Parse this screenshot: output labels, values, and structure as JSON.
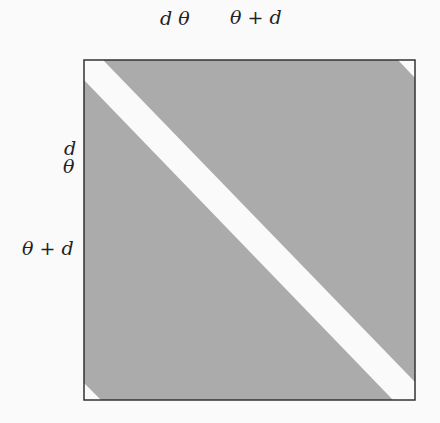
{
  "figure": {
    "type": "shaded-square-diagram",
    "colors": {
      "fill": "#ababab",
      "band": "#fafafa",
      "border": "#333333"
    },
    "square": {
      "x": 84,
      "y": 60,
      "width": 331,
      "height": 340
    },
    "top_labels": [
      {
        "text": "d θ",
        "x": 160,
        "y": 9
      },
      {
        "text": "θ + d",
        "x": 230,
        "y": 8
      }
    ],
    "left_labels": [
      {
        "text": "d",
        "x": 62,
        "y": 139
      },
      {
        "text": "θ",
        "x": 62,
        "y": 158
      },
      {
        "text": "θ + d",
        "x": 22,
        "y": 239
      }
    ],
    "regions": {
      "diagonal_band": "84,60 103,60 415,382 415,400 393,400 84,80",
      "top_right_corner": "398,60 415,60 415,78",
      "bottom_left_corner": "84,383 84,400 101,400"
    }
  }
}
